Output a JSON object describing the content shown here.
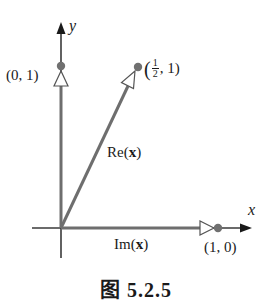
{
  "diagram": {
    "axes": {
      "x_label": "x",
      "y_label": "y"
    },
    "points": [
      {
        "label": "(0, 1)",
        "x": 0,
        "y": 1
      },
      {
        "label_open": "(",
        "frac_num": "1",
        "frac_den": "2",
        "label_rest": ", 1)",
        "x": 0.5,
        "y": 1
      },
      {
        "label": "(1, 0)",
        "x": 1,
        "y": 0
      }
    ],
    "vectors": {
      "re": {
        "label_prefix": "Re(",
        "label_var": "x",
        "label_suffix": ")"
      },
      "im": {
        "label_prefix": "Im(",
        "label_var": "x",
        "label_suffix": ")"
      }
    },
    "colors": {
      "axis": "#3a3a3a",
      "vector": "#6e6e6e",
      "dot": "#707070"
    },
    "caption": "图 5.2.5"
  }
}
